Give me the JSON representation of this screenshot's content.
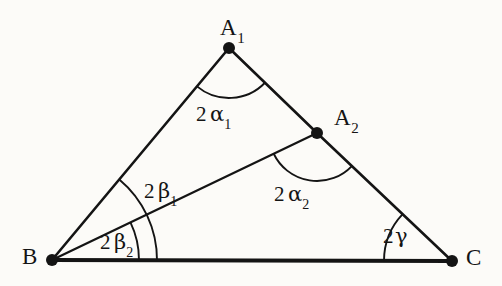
{
  "figure": {
    "background_color": "#fcfbf8",
    "stroke_color": "#141414",
    "width": 502,
    "height": 286,
    "vertices": [
      {
        "id": "A1",
        "name": "A",
        "subscript": "1",
        "x": 229,
        "y": 48,
        "label_x": 220,
        "label_y": 16
      },
      {
        "id": "A2",
        "name": "A",
        "subscript": "2",
        "x": 317,
        "y": 133,
        "label_x": 334,
        "label_y": 106
      },
      {
        "id": "B",
        "name": "B",
        "subscript": "",
        "x": 52,
        "y": 260,
        "label_x": 22,
        "label_y": 245
      },
      {
        "id": "C",
        "name": "C",
        "subscript": "",
        "x": 452,
        "y": 261,
        "label_x": 466,
        "label_y": 246
      }
    ],
    "segments": [
      {
        "id": "B-A1",
        "from": "B",
        "to": "A1",
        "width": 2.6
      },
      {
        "id": "A1-A2",
        "from": "A1",
        "to": "A2",
        "width": 2.6
      },
      {
        "id": "A2-C",
        "from": "A2",
        "to": "C",
        "width": 2.6
      },
      {
        "id": "B-C",
        "from": "B",
        "to": "C",
        "width": 4.2
      },
      {
        "id": "B-A2",
        "from": "B",
        "to": "A2",
        "width": 2.2
      }
    ],
    "angle_arcs": [
      {
        "id": "arc-A1",
        "vertex": "A1",
        "radius": 50,
        "from": "B",
        "to": "A2"
      },
      {
        "id": "arc-A2",
        "vertex": "A2",
        "radius": 48,
        "from": "B",
        "to": "C"
      },
      {
        "id": "arc-C",
        "vertex": "C",
        "radius": 68,
        "from": "B",
        "to": "A2"
      },
      {
        "id": "arc-B-outer",
        "vertex": "B",
        "radius": 105,
        "from": "C",
        "to": "A1"
      },
      {
        "id": "arc-B-inner",
        "vertex": "B",
        "radius": 87,
        "from": "C",
        "to": "A2"
      }
    ],
    "angle_labels": [
      {
        "id": "label-2alpha1",
        "coefficient": "2",
        "symbol": "α",
        "subscript": "1",
        "x": 196,
        "y": 104
      },
      {
        "id": "label-2alpha2",
        "coefficient": "2",
        "symbol": "α",
        "subscript": "2",
        "x": 274,
        "y": 184
      },
      {
        "id": "label-2beta1",
        "coefficient": "2",
        "symbol": "β",
        "subscript": "1",
        "x": 144,
        "y": 181
      },
      {
        "id": "label-2beta2",
        "coefficient": "2",
        "symbol": "β",
        "subscript": "2",
        "x": 100,
        "y": 232
      },
      {
        "id": "label-2gamma",
        "coefficient": "2",
        "symbol": "γ",
        "subscript": "",
        "x": 383,
        "y": 226
      }
    ]
  }
}
